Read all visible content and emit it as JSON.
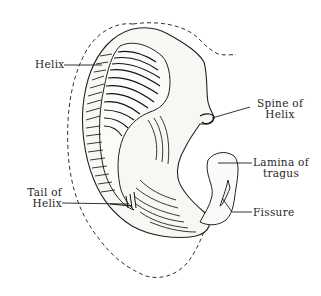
{
  "figure": {
    "colors": {
      "ink": "#1e1e1e",
      "background": "#ffffff",
      "dashed_outline": "#333333"
    }
  },
  "labels": {
    "helix": {
      "text": "Helix"
    },
    "spine_of_helix": {
      "line1": "Spine of",
      "line2": "Helix"
    },
    "lamina_of_tragus": {
      "line1": "Lamina of",
      "line2": "tragus"
    },
    "tail_of_helix": {
      "line1": "Tail of",
      "line2": "Helix"
    },
    "fissure": {
      "text": "Fissure"
    }
  }
}
